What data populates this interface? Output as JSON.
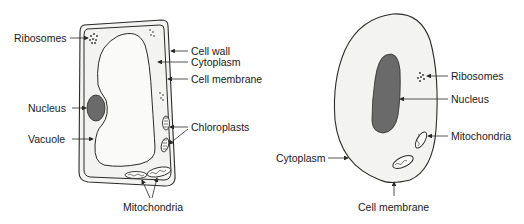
{
  "colors": {
    "outline": "#2a2a2a",
    "cell_fill": "#f3f3f1",
    "vacuole_fill": "#fafaf8",
    "nucleus_fill": "#6a6a6a",
    "text": "#1a1a1a"
  },
  "plant_cell": {
    "labels": {
      "ribosomes": "Ribosomes",
      "cell_wall": "Cell wall",
      "cytoplasm": "Cytoplasm",
      "cell_membrane": "Cell membrane",
      "nucleus": "Nucleus",
      "vacuole": "Vacuole",
      "chloroplasts": "Chloroplasts",
      "mitochondria": "Mitochondria"
    }
  },
  "animal_cell": {
    "labels": {
      "ribosomes": "Ribosomes",
      "nucleus": "Nucleus",
      "mitochondria": "Mitochondria",
      "cytoplasm": "Cytoplasm",
      "cell_membrane": "Cell membrane"
    }
  }
}
